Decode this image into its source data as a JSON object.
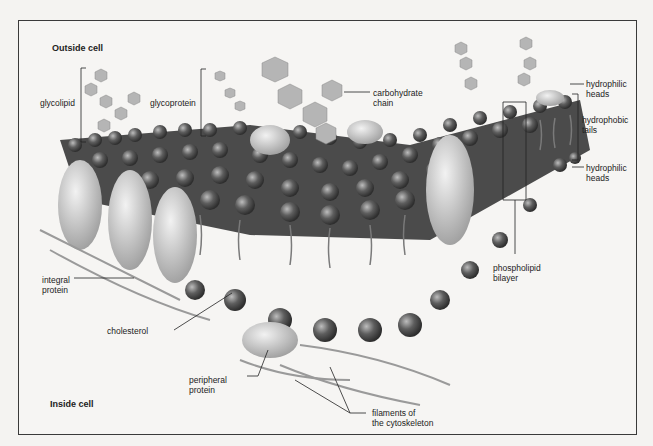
{
  "diagram": {
    "regions": {
      "outside": "Outside cell",
      "inside": "Inside cell"
    },
    "labels": {
      "glycolipid": "glycolipid",
      "glycoprotein": "glycoprotein",
      "carbohydrate_1": "carbohydrate",
      "carbohydrate_2": "chain",
      "hydrophilic_top_1": "hydrophilic",
      "hydrophilic_top_2": "heads",
      "hydrophobic_1": "hydrophobic",
      "hydrophobic_2": "tails",
      "hydrophilic_bot_1": "hydrophilic",
      "hydrophilic_bot_2": "heads",
      "phospholipid_1": "phospholipid",
      "phospholipid_2": "bilayer",
      "integral_1": "integral",
      "integral_2": "protein",
      "cholesterol": "cholesterol",
      "peripheral_1": "peripheral",
      "peripheral_2": "protein",
      "filaments_1": "filaments of",
      "filaments_2": "the cytoskeleton"
    },
    "colors": {
      "border": "#3a3a3a",
      "head": "#5a5a5a",
      "protein": "#cfcfcf",
      "sugar": "#a8a8a8"
    }
  }
}
